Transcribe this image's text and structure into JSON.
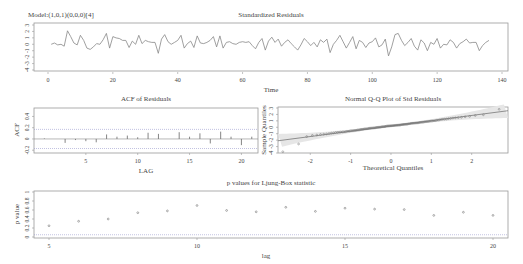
{
  "chart_data": [
    {
      "type": "line",
      "title": "Standardized Residuals",
      "subtitle": "Model:(1,0,1)(0,0,0)[4]",
      "xlabel": "Time",
      "ylabel": "",
      "xlim": [
        0,
        140
      ],
      "ylim": [
        -4,
        3
      ],
      "xticks": [
        0,
        20,
        40,
        60,
        80,
        100,
        120,
        140
      ],
      "yticks": [
        3,
        2,
        1,
        0,
        -1,
        -2,
        -3,
        -4
      ],
      "x_start": 1,
      "values": [
        0.0,
        0.2,
        -0.1,
        0.0,
        -0.3,
        2.1,
        1.2,
        0.2,
        -0.1,
        1.4,
        0.6,
        -0.6,
        -0.8,
        -0.4,
        0.1,
        0.0,
        0.7,
        1.7,
        -0.6,
        1.2,
        1.0,
        0.9,
        0.6,
        0.6,
        -0.5,
        0.5,
        0.0,
        1.4,
        0.1,
        0.6,
        0.4,
        0.3,
        0.3,
        -1.4,
        0.8,
        1.5,
        0.4,
        0.0,
        0.3,
        0.6,
        1.4,
        -0.6,
        0.1,
        0.5,
        -0.5,
        1.3,
        0.2,
        0.1,
        0.3,
        0.6,
        1.2,
        -0.4,
        1.3,
        -0.6,
        0.3,
        0.4,
        0.1,
        0.0,
        0.3,
        0.4,
        0.3,
        0.4,
        -0.2,
        -0.7,
        0.3,
        0.9,
        -0.9,
        0.5,
        1.1,
        0.3,
        0.8,
        -0.3,
        0.3,
        0.7,
        0.1,
        -0.4,
        -0.9,
        -0.1,
        0.9,
        0.4,
        -0.2,
        0.3,
        -0.4,
        0.7,
        0.3,
        0.8,
        -1.3,
        0.0,
        0.6,
        1.4,
        0.4,
        -0.6,
        0.3,
        1.2,
        -0.7,
        0.6,
        0.3,
        -0.5,
        0.2,
        0.4,
        1.0,
        -0.4,
        -0.1,
        0.8,
        -1.8,
        -0.4,
        1.5,
        1.7,
        0.6,
        -0.2,
        0.3,
        0.9,
        -0.3,
        -0.9,
        0.7,
        0.2,
        -1.0,
        0.3,
        0.0,
        0.9,
        -0.6,
        0.0,
        -0.1,
        0.7,
        0.3,
        -0.6,
        0.1,
        0.4,
        0.8,
        0.2,
        0.3,
        0.3,
        -1.0,
        -0.2,
        0.3,
        0.6
      ],
      "grid": false
    },
    {
      "type": "bar",
      "title": "ACF of Residuals",
      "xlabel": "LAG",
      "ylabel": "ACF",
      "xlim": [
        0,
        21
      ],
      "ylim": [
        -0.25,
        0.55
      ],
      "xticks": [
        5,
        10,
        15,
        20
      ],
      "yticks": [
        -0.2,
        0.0,
        0.2,
        0.4
      ],
      "categories": [
        1,
        2,
        3,
        4,
        5,
        6,
        7,
        8,
        9,
        10,
        11,
        12,
        13,
        14,
        15,
        16,
        17,
        18,
        19,
        20,
        21
      ],
      "values": [
        0.01,
        0.0,
        -0.07,
        -0.02,
        -0.04,
        -0.06,
        0.08,
        0.04,
        0.06,
        0.03,
        0.11,
        0.09,
        0.0,
        0.12,
        0.04,
        0.1,
        -0.08,
        0.13,
        0.04,
        -0.11,
        0.04
      ],
      "confidence_band": [
        -0.17,
        0.17
      ]
    },
    {
      "type": "scatter",
      "title": "Normal Q-Q Plot of Std Residuals",
      "xlabel": "Theoretical Quantiles",
      "ylabel": "Sample Quantiles",
      "xlim": [
        -2.8,
        2.9
      ],
      "ylim": [
        -4,
        3
      ],
      "xticks": [
        -2,
        -1,
        0,
        1,
        2
      ],
      "yticks": [
        3,
        2,
        1,
        0,
        -1,
        -2,
        -3,
        -4
      ],
      "reference_line": {
        "intercept": 0.2,
        "slope": 0.82
      },
      "points_summary": "Points follow line closely in center; lower tail below line (min ≈ -3.8 at x≈-2.7), upper outlier ≈ 2.8 at x≈2.7"
    },
    {
      "type": "scatter",
      "title": "p values for Ljung-Box statistic",
      "xlabel": "lag",
      "ylabel": "p value",
      "xlim": [
        4.5,
        20.5
      ],
      "ylim": [
        0,
        1
      ],
      "xticks": [
        5,
        10,
        15,
        20
      ],
      "yticks": [
        0.0,
        0.2,
        0.4,
        0.6,
        0.8,
        1.0
      ],
      "x": [
        5,
        6,
        7,
        8,
        9,
        10,
        11,
        12,
        13,
        14,
        15,
        16,
        17,
        18,
        19,
        20
      ],
      "values": [
        0.25,
        0.35,
        0.4,
        0.54,
        0.58,
        0.7,
        0.59,
        0.56,
        0.66,
        0.57,
        0.64,
        0.62,
        0.61,
        0.48,
        0.55,
        0.48
      ],
      "threshold_line": 0.05
    }
  ],
  "labels": {
    "model": "Model:(1,0,1)(0,0,0)[4]",
    "top_title": "Standardized Residuals",
    "top_xlabel": "Time",
    "acf_title": "ACF of Residuals",
    "acf_xlabel": "LAG",
    "acf_ylabel": "ACF",
    "qq_title": "Normal Q-Q Plot of Std Residuals",
    "qq_xlabel": "Theoretical Quantiles",
    "qq_ylabel": "Sample Quantiles",
    "lb_title": "p values for Ljung-Box statistic",
    "lb_xlabel": "lag",
    "lb_ylabel": "p value"
  },
  "colors": {
    "line": "#888888",
    "frame": "#999999",
    "text": "#444444",
    "dotted": "#9999cc",
    "points": "#777777",
    "band": "#e4e4e4"
  }
}
